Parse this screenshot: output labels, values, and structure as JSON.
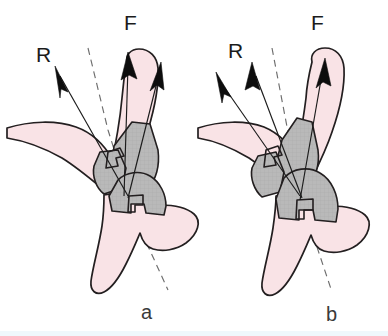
{
  "figure": {
    "background_color": "#ffffff",
    "bottom_strip_color": "#eff8fc",
    "bone_fill_color": "#f9e3e6",
    "graft_fill_color": "#b9b9b9",
    "outline_color": "#231f20",
    "vector_color": "#0d0d0d",
    "axis_color": "#6d6d6d",
    "label_color": "#1b1b1b",
    "panel_label_color": "#3a3a3a"
  },
  "panels": [
    {
      "id": "a",
      "caption": "a",
      "vectors": [
        {
          "name": "R",
          "label": "R",
          "description": "resultant-vector-arrow-left-panel"
        },
        {
          "name": "F",
          "label": "F",
          "description": "force-vector-arrow-left-panel"
        }
      ],
      "axis": {
        "name": "reference-axis",
        "style": "dashed"
      },
      "regions": [
        {
          "name": "vertebral-body-bone",
          "fill": "bone"
        },
        {
          "name": "spinous-process-bone",
          "fill": "bone"
        },
        {
          "name": "graft-wedge-upper",
          "fill": "graft"
        },
        {
          "name": "graft-wedge-mid",
          "fill": "graft"
        },
        {
          "name": "graft-wedge-lower",
          "fill": "graft"
        }
      ]
    },
    {
      "id": "b",
      "caption": "b",
      "vectors": [
        {
          "name": "R",
          "label": "R",
          "description": "resultant-vector-arrow-right-panel"
        },
        {
          "name": "F",
          "label": "F",
          "description": "force-vector-arrow-right-panel"
        }
      ],
      "axis": {
        "name": "reference-axis",
        "style": "dashed"
      },
      "regions": [
        {
          "name": "vertebral-body-bone",
          "fill": "bone"
        },
        {
          "name": "spinous-process-bone",
          "fill": "bone"
        },
        {
          "name": "graft-wedge-upper",
          "fill": "graft"
        },
        {
          "name": "graft-wedge-mid",
          "fill": "graft"
        },
        {
          "name": "graft-wedge-lower",
          "fill": "graft"
        }
      ]
    }
  ],
  "labels": {
    "panel_a_caption": "a",
    "panel_b_caption": "b",
    "panel_a_force": "F",
    "panel_a_resultant": "R",
    "panel_b_force": "F",
    "panel_b_resultant": "R"
  }
}
